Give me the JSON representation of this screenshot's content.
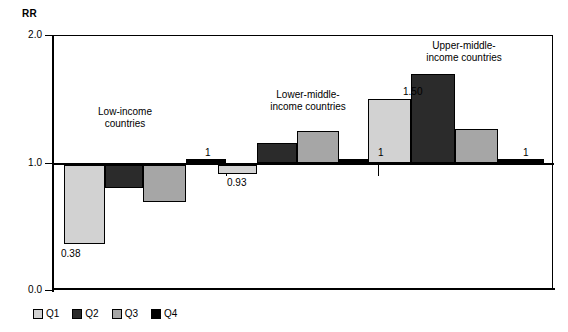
{
  "chart_data": {
    "type": "bar",
    "title": "",
    "ylabel": "RR",
    "xlabel": "",
    "ylim": [
      0.0,
      2.0
    ],
    "yticks": [
      "0.0",
      "1.0",
      "2.0"
    ],
    "baseline": 1.0,
    "grid": false,
    "legend_position": "bottom-left",
    "categories": [
      "Low-income countries",
      "Lower-middle-income countries",
      "Upper-middle-income countries"
    ],
    "series": [
      {
        "name": "Q1",
        "color": "#d2d2d2",
        "values": [
          0.38,
          0.93,
          1.5
        ]
      },
      {
        "name": "Q2",
        "color": "#2b2b2b",
        "values": [
          0.82,
          1.16,
          1.7
        ]
      },
      {
        "name": "Q3",
        "color": "#a6a6a6",
        "values": [
          0.71,
          1.25,
          1.27
        ]
      },
      {
        "name": "Q4",
        "color": "#000000",
        "values": [
          1.0,
          1.0,
          1.0
        ]
      }
    ],
    "annotations": [
      {
        "text": "0.38",
        "series": "Q1",
        "group": "Low-income countries"
      },
      {
        "text": "1",
        "series": "Q4",
        "group": "Low-income countries"
      },
      {
        "text": "0.93",
        "series": "Q1",
        "group": "Lower-middle-income countries"
      },
      {
        "text": "1",
        "series": "Q4",
        "group": "Lower-middle-income countries"
      },
      {
        "text": "1.50",
        "series": "Q1",
        "group": "Upper-middle-income countries"
      },
      {
        "text": "1",
        "series": "Q4",
        "group": "Upper-middle-income countries"
      }
    ]
  },
  "axis": {
    "y_title": "RR",
    "tick_top": "2.0",
    "tick_mid": "1.0",
    "tick_bottom": "0.0"
  },
  "groups": {
    "low": {
      "line1": "Low-income",
      "line2": "countries"
    },
    "lower_middle": {
      "line1": "Lower-middle-",
      "line2": "income countries"
    },
    "upper_middle": {
      "line1": "Upper-middle-",
      "line2": "income countries"
    }
  },
  "values": {
    "low_q1": "0.38",
    "low_q4": "1",
    "lowmid_q1": "0.93",
    "lowmid_q4": "1",
    "uppmid_q1": "1.50",
    "uppmid_q4": "1"
  },
  "legend": {
    "items": [
      {
        "label": "Q1",
        "color": "#d2d2d2"
      },
      {
        "label": "Q2",
        "color": "#2b2b2b"
      },
      {
        "label": "Q3",
        "color": "#a6a6a6"
      },
      {
        "label": "Q4",
        "color": "#000000"
      }
    ]
  }
}
